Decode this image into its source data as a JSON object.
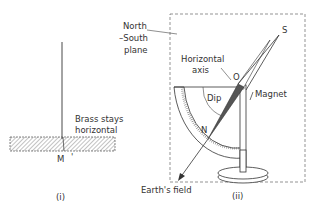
{
  "diagram": {
    "panel_i": {
      "caption": "(i)",
      "bar_label_line1": "Brass stays",
      "bar_label_line2": "horizontal",
      "point_label": "M",
      "point_mark": "'"
    },
    "panel_ii": {
      "caption": "(ii)",
      "plane_label_line1": "North",
      "plane_label_line2": "–South",
      "plane_label_line3": "plane",
      "axis_label_line1": "Horizontal",
      "axis_label_line2": "axis",
      "pivot_label": "O",
      "south_label": "S",
      "north_label": "N",
      "dip_label": "Dip",
      "magnet_label": "Magnet",
      "field_label": "Earth's field"
    },
    "colors": {
      "line": "#333333",
      "magnet_fill": "#555555",
      "hatch": "#666666",
      "background": "#ffffff"
    }
  }
}
